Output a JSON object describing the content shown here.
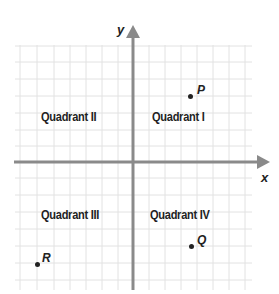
{
  "diagram": {
    "type": "coordinate-plane",
    "axes": {
      "x_label": "x",
      "y_label": "y"
    },
    "quadrants": [
      {
        "id": "I",
        "label": "Quadrant I"
      },
      {
        "id": "II",
        "label": "Quadrant II"
      },
      {
        "id": "III",
        "label": "Quadrant III"
      },
      {
        "id": "IV",
        "label": "Quadrant IV"
      }
    ],
    "points": [
      {
        "name": "P",
        "quadrant": "I"
      },
      {
        "name": "Q",
        "quadrant": "IV"
      },
      {
        "name": "R",
        "quadrant": "III"
      }
    ],
    "colors": {
      "grid": "#e2e2e2",
      "axis": "#8a8a8a",
      "text": "#222222"
    }
  }
}
